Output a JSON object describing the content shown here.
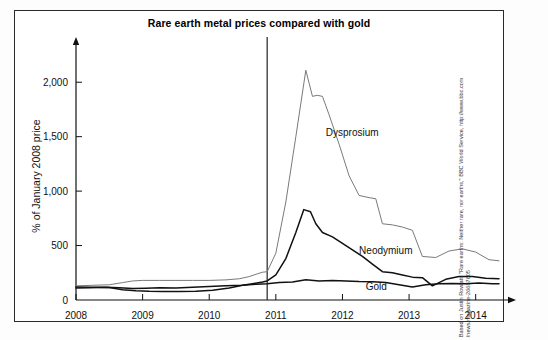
{
  "figure": {
    "title": "Rare earth metal prices compared with gold",
    "credit_line1": "Based on Justin Rowlatt, \"Rare earths: Neither rare, nor earths,\" BBC World Service, http://www.bbc.com",
    "credit_line2": "/news/magazine-26687605"
  },
  "chart_data": {
    "type": "line",
    "title": "Rare earth metal prices compared with gold",
    "xlabel": "",
    "ylabel": "% of January 2008 price",
    "xlim": [
      2008.0,
      2014.35
    ],
    "ylim": [
      0,
      2250
    ],
    "xticks": [
      "2008",
      "2009",
      "2010",
      "2011",
      "2012",
      "2013",
      "2014"
    ],
    "xtick_values": [
      2008,
      2009,
      2010,
      2011,
      2012,
      2013,
      2014
    ],
    "yticks": [
      "0",
      "500",
      "1,000",
      "1,500",
      "2,000"
    ],
    "ytick_values": [
      0,
      500,
      1000,
      1500,
      2000
    ],
    "grid": false,
    "legend": "inline-labels",
    "annotations": [
      {
        "text": "Dysprosium",
        "x": 2011.75,
        "y": 1510
      },
      {
        "text": "Neodymium",
        "x": 2012.25,
        "y": 420
      },
      {
        "text": "Gold",
        "x": 2012.35,
        "y": 95
      }
    ],
    "reference_line": {
      "x": 2010.87,
      "label": "",
      "color": "#333333"
    },
    "series": [
      {
        "name": "Dysprosium",
        "color": "#7a7a7a",
        "x": [
          2008.0,
          2008.25,
          2008.5,
          2008.7,
          2008.85,
          2009.0,
          2009.25,
          2009.5,
          2009.75,
          2010.0,
          2010.25,
          2010.45,
          2010.6,
          2010.72,
          2010.8,
          2010.87,
          2011.0,
          2011.15,
          2011.3,
          2011.45,
          2011.55,
          2011.62,
          2011.7,
          2011.8,
          2011.95,
          2012.1,
          2012.25,
          2012.4,
          2012.5,
          2012.6,
          2012.75,
          2012.9,
          2013.05,
          2013.2,
          2013.4,
          2013.6,
          2013.8,
          2014.0,
          2014.2,
          2014.35
        ],
        "y": [
          130,
          135,
          140,
          160,
          175,
          180,
          180,
          180,
          180,
          180,
          185,
          195,
          215,
          240,
          255,
          260,
          430,
          900,
          1500,
          2110,
          1870,
          1880,
          1870,
          1700,
          1430,
          1140,
          960,
          940,
          930,
          700,
          690,
          670,
          640,
          400,
          390,
          450,
          470,
          440,
          370,
          360
        ]
      },
      {
        "name": "Neodymium",
        "color": "#111111",
        "x": [
          2008.0,
          2008.25,
          2008.5,
          2008.7,
          2008.9,
          2009.1,
          2009.3,
          2009.55,
          2009.8,
          2010.05,
          2010.3,
          2010.5,
          2010.65,
          2010.8,
          2010.87,
          2011.0,
          2011.15,
          2011.3,
          2011.42,
          2011.52,
          2011.6,
          2011.7,
          2011.85,
          2012.0,
          2012.15,
          2012.3,
          2012.45,
          2012.6,
          2012.75,
          2012.9,
          2013.05,
          2013.2,
          2013.35,
          2013.55,
          2013.75,
          2013.95,
          2014.15,
          2014.35
        ],
        "y": [
          120,
          118,
          115,
          95,
          85,
          80,
          78,
          78,
          80,
          90,
          110,
          135,
          150,
          165,
          175,
          230,
          380,
          620,
          830,
          810,
          700,
          620,
          580,
          520,
          460,
          400,
          330,
          260,
          250,
          230,
          210,
          205,
          130,
          190,
          215,
          215,
          200,
          195
        ]
      },
      {
        "name": "Gold",
        "color": "#111111",
        "x": [
          2008.0,
          2008.2,
          2008.45,
          2008.65,
          2008.85,
          2009.05,
          2009.25,
          2009.5,
          2009.75,
          2010.0,
          2010.25,
          2010.5,
          2010.7,
          2010.87,
          2011.05,
          2011.25,
          2011.45,
          2011.65,
          2011.85,
          2012.05,
          2012.25,
          2012.45,
          2012.65,
          2012.85,
          2013.05,
          2013.25,
          2013.45,
          2013.65,
          2013.85,
          2014.05,
          2014.25,
          2014.35
        ],
        "y": [
          110,
          112,
          118,
          112,
          105,
          108,
          112,
          110,
          118,
          125,
          130,
          135,
          145,
          150,
          160,
          165,
          185,
          175,
          180,
          175,
          170,
          168,
          160,
          140,
          120,
          140,
          150,
          152,
          150,
          155,
          150,
          150
        ]
      }
    ]
  }
}
